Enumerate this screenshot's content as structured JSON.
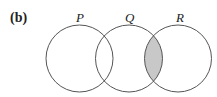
{
  "figure": {
    "part_label": "(b)",
    "diagram_type": "venn",
    "sets": [
      {
        "label": "P",
        "cx": 79.5,
        "cy": 58.5,
        "r": 33.5
      },
      {
        "label": "Q",
        "cx": 129,
        "cy": 58.5,
        "r": 33.5
      },
      {
        "label": "R",
        "cx": 178,
        "cy": 58.5,
        "r": 33.5
      }
    ],
    "shaded_region": "Q ∩ R",
    "colors": {
      "stroke": "#555555",
      "shade": "#c8c8c8",
      "background": "#ffffff"
    }
  }
}
